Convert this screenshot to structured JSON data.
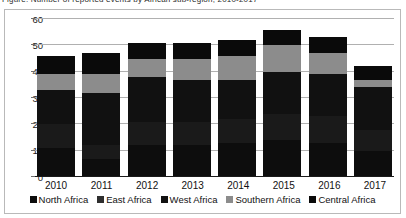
{
  "caption": {
    "clipped_line": "Figure: Number of reported events by African sub-region, 2010-2017"
  },
  "chart_data": {
    "type": "bar",
    "stacked": true,
    "title": "",
    "subtitle": "",
    "xlabel": "",
    "ylabel": "",
    "categories": [
      "2010",
      "2011",
      "2012",
      "2013",
      "2014",
      "2015",
      "2016",
      "2017"
    ],
    "ylim": [
      0,
      60
    ],
    "yticks": [
      0,
      10,
      20,
      30,
      40,
      50,
      60
    ],
    "ytick_labels": [
      "0",
      "10",
      "20",
      "30",
      "40",
      "50",
      "60"
    ],
    "grid": true,
    "grid_axis": "y",
    "legend_position": "bottom",
    "series": [
      {
        "name": "North Africa",
        "color": "#0d0d0d",
        "values": [
          11,
          7,
          12,
          12,
          13,
          14,
          13,
          10
        ]
      },
      {
        "name": "East Africa",
        "color": "#1a1a1a",
        "values": [
          9,
          5,
          9,
          9,
          9,
          10,
          10,
          8
        ]
      },
      {
        "name": "West Africa",
        "color": "#111111",
        "values": [
          13,
          20,
          17,
          16,
          15,
          16,
          16,
          16
        ]
      },
      {
        "name": "Southern Africa",
        "color": "#8c8c8c",
        "values": [
          6,
          7,
          7,
          8,
          9,
          10,
          8,
          3
        ]
      },
      {
        "name": "Central Africa",
        "color": "#0a0a0a",
        "values": [
          7,
          8,
          6,
          6,
          6,
          6,
          6,
          5
        ]
      }
    ],
    "totals": [
      46,
      47,
      51,
      51,
      52,
      56,
      53,
      42
    ]
  },
  "legend": {
    "items": [
      {
        "label": "North Africa",
        "color": "#0d0d0d"
      },
      {
        "label": "East Africa",
        "color": "#2e2e2e"
      },
      {
        "label": "West Africa",
        "color": "#111111"
      },
      {
        "label": "Southern Africa",
        "color": "#8c8c8c"
      },
      {
        "label": "Central Africa",
        "color": "#0a0a0a"
      }
    ]
  }
}
